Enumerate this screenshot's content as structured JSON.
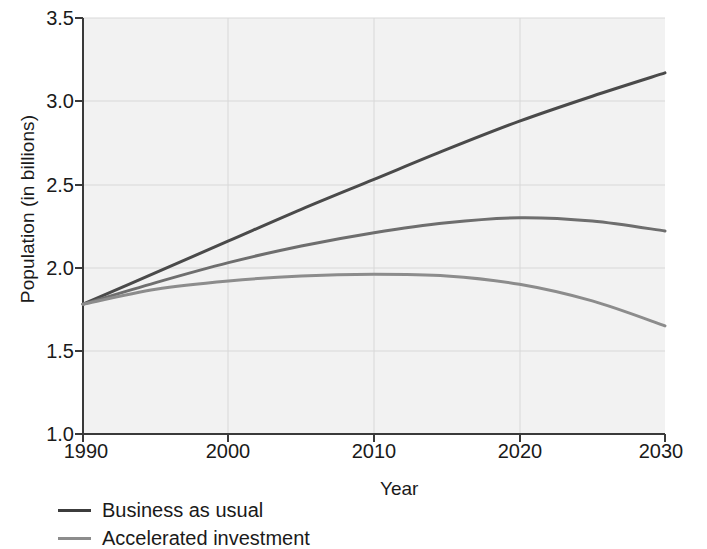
{
  "chart_data": {
    "type": "line",
    "title": "",
    "subtitle": "",
    "xlabel": "Year",
    "ylabel": "Population (in billions)",
    "xlim": [
      1990,
      2030
    ],
    "ylim": [
      1.0,
      3.5
    ],
    "xticks": [
      1990,
      2000,
      2010,
      2020,
      2030
    ],
    "yticks": [
      "1.0",
      "1.5",
      "2.0",
      "2.5",
      "3.0",
      "3.5"
    ],
    "grid": true,
    "legend_position": "below-left",
    "plot_background": "#f2f2f2",
    "x": [
      1990,
      1995,
      2000,
      2005,
      2010,
      2015,
      2020,
      2025,
      2030
    ],
    "series": [
      {
        "name": "Business as usual",
        "color": "#4a4a4a",
        "values": [
          1.78,
          1.97,
          2.16,
          2.35,
          2.53,
          2.71,
          2.88,
          3.03,
          3.17
        ]
      },
      {
        "name": "Moderate investment",
        "color": "#6e6e6e",
        "values": [
          1.78,
          1.91,
          2.03,
          2.13,
          2.21,
          2.27,
          2.3,
          2.28,
          2.22
        ]
      },
      {
        "name": "Accelerated investment",
        "color": "#8c8c8c",
        "values": [
          1.78,
          1.87,
          1.92,
          1.95,
          1.96,
          1.95,
          1.9,
          1.8,
          1.65
        ]
      }
    ]
  },
  "legend": {
    "entries": [
      {
        "label": "Business as usual",
        "color": "#3c3c3c"
      },
      {
        "label": "Accelerated investment",
        "color": "#8c8c8c"
      }
    ]
  }
}
